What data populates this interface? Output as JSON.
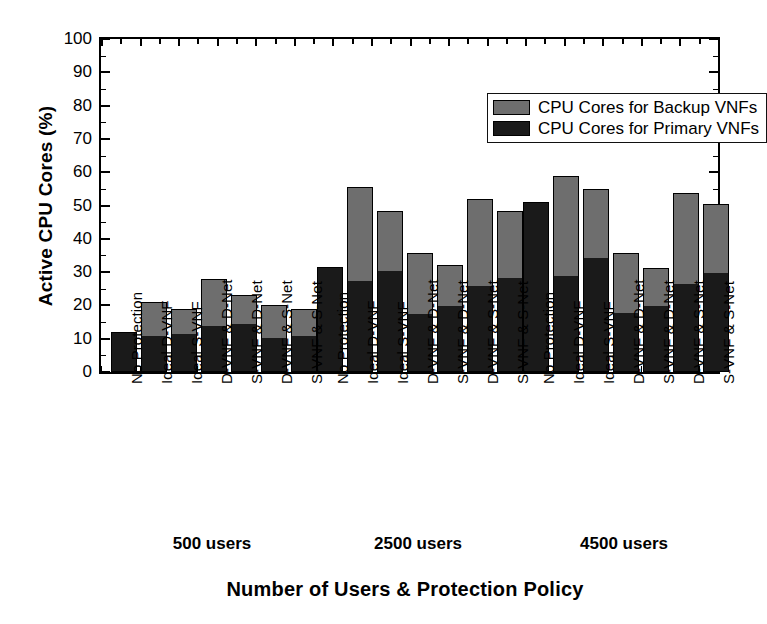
{
  "chart_data": {
    "type": "bar",
    "subtype": "stacked-grouped",
    "title": "",
    "xlabel": "Number of Users & Protection Policy",
    "ylabel": "Active CPU Cores (%)",
    "ylim": [
      0,
      100
    ],
    "ytick_step": 10,
    "yticks": [
      0,
      10,
      20,
      30,
      40,
      50,
      60,
      70,
      80,
      90,
      100
    ],
    "ytick_labels": [
      "0",
      "10",
      "20",
      "30",
      "40",
      "50",
      "60",
      "70",
      "80",
      "90",
      "100"
    ],
    "minor_ticks": true,
    "grid": false,
    "legend_position": "top-right-inside",
    "legend": [
      {
        "label": "CPU Cores for Backup VNFs",
        "color": "#6e6e6e",
        "key": "backup"
      },
      {
        "label": "CPU Cores for Primary VNFs",
        "color": "#1a1a1a",
        "key": "primary"
      }
    ],
    "categories": [
      "No Protection",
      "Ideal D-VNF",
      "Ideal S-VNF",
      "D-VNF & D-Net",
      "S-VNF & D-Net",
      "D-VNF & S-Net",
      "S-VNF & S-Net"
    ],
    "groups": [
      {
        "name": "500 users",
        "bars": [
          {
            "category": "No Protection",
            "primary": 12.0,
            "backup": 0.0,
            "total": 12.0
          },
          {
            "category": "Ideal D-VNF",
            "primary": 10.5,
            "backup": 10.5,
            "total": 21.0
          },
          {
            "category": "Ideal S-VNF",
            "primary": 11.0,
            "backup": 8.0,
            "total": 19.0
          },
          {
            "category": "D-VNF & D-Net",
            "primary": 13.5,
            "backup": 14.5,
            "total": 28.0
          },
          {
            "category": "S-VNF & D-Net",
            "primary": 14.0,
            "backup": 9.0,
            "total": 23.0
          },
          {
            "category": "D-VNF & S-Net",
            "primary": 10.0,
            "backup": 10.0,
            "total": 20.0
          },
          {
            "category": "S-VNF & S-Net",
            "primary": 10.5,
            "backup": 8.5,
            "total": 19.0
          }
        ]
      },
      {
        "name": "2500 users",
        "bars": [
          {
            "category": "No Protection",
            "primary": 31.5,
            "backup": 0.0,
            "total": 31.5
          },
          {
            "category": "Ideal D-VNF",
            "primary": 27.0,
            "backup": 28.5,
            "total": 55.5
          },
          {
            "category": "Ideal S-VNF",
            "primary": 30.0,
            "backup": 18.5,
            "total": 48.5
          },
          {
            "category": "D-VNF & D-Net",
            "primary": 17.0,
            "backup": 18.8,
            "total": 35.8
          },
          {
            "category": "S-VNF & D-Net",
            "primary": 19.5,
            "backup": 12.5,
            "total": 32.0
          },
          {
            "category": "D-VNF & S-Net",
            "primary": 25.5,
            "backup": 26.5,
            "total": 52.0
          },
          {
            "category": "S-VNF & S-Net",
            "primary": 28.0,
            "backup": 20.5,
            "total": 48.5
          }
        ]
      },
      {
        "name": "4500 users",
        "bars": [
          {
            "category": "No Protection",
            "primary": 51.0,
            "backup": 0.0,
            "total": 51.0
          },
          {
            "category": "Ideal D-VNF",
            "primary": 28.5,
            "backup": 30.5,
            "total": 59.0
          },
          {
            "category": "Ideal S-VNF",
            "primary": 34.0,
            "backup": 21.0,
            "total": 55.0
          },
          {
            "category": "D-VNF & D-Net",
            "primary": 17.5,
            "backup": 18.3,
            "total": 35.8
          },
          {
            "category": "S-VNF & D-Net",
            "primary": 19.5,
            "backup": 11.8,
            "total": 31.3
          },
          {
            "category": "D-VNF & S-Net",
            "primary": 26.0,
            "backup": 27.8,
            "total": 53.8
          },
          {
            "category": "S-VNF & S-Net",
            "primary": 29.5,
            "backup": 21.0,
            "total": 50.5
          }
        ]
      }
    ]
  }
}
